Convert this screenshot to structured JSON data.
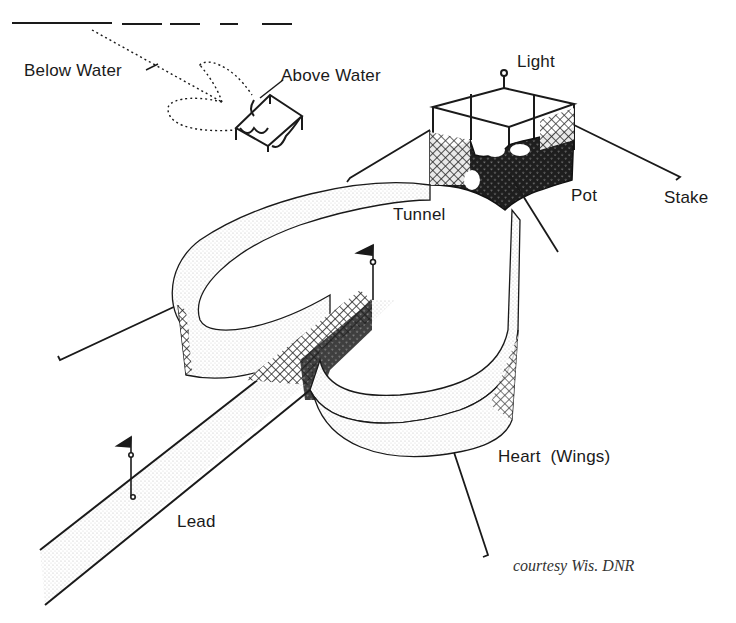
{
  "figure": {
    "labels": {
      "below_water": "Below Water",
      "above_water": "Above Water",
      "light": "Light",
      "tunnel": "Tunnel",
      "pot": "Pot",
      "stake": "Stake",
      "heart": "Heart  (Wings)",
      "lead": "Lead"
    },
    "credit": "courtesy Wis. DNR",
    "colors": {
      "ink": "#1a1a1a",
      "mesh_fill": "#2a2a2a",
      "light_shade": "#e6e6e6",
      "background": "#ffffff"
    }
  }
}
